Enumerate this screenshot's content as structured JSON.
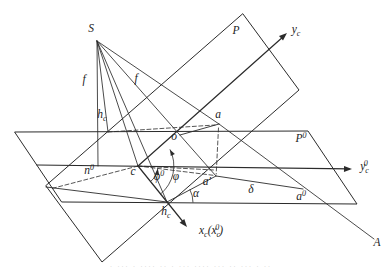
{
  "figure": {
    "background": "#ffffff",
    "line_color": "#2b2b2b",
    "labels": [
      {
        "id": "S",
        "x": 91,
        "y": 29,
        "seg": [
          {
            "t": "S"
          }
        ]
      },
      {
        "id": "f-left",
        "x": 84,
        "y": 80,
        "seg": [
          {
            "t": "f"
          }
        ]
      },
      {
        "id": "f-right",
        "x": 136,
        "y": 79,
        "seg": [
          {
            "t": "f"
          }
        ]
      },
      {
        "id": "P",
        "x": 236,
        "y": 31,
        "seg": [
          {
            "t": "P"
          }
        ]
      },
      {
        "id": "y-c",
        "x": 296,
        "y": 31,
        "seg": [
          {
            "t": "y"
          },
          {
            "t": "c",
            "m": "sub"
          }
        ]
      },
      {
        "id": "h-c-upper",
        "x": 102,
        "y": 116,
        "seg": [
          {
            "t": "h"
          },
          {
            "t": "c",
            "m": "sub"
          }
        ]
      },
      {
        "id": "a",
        "x": 218,
        "y": 115,
        "seg": [
          {
            "t": "a"
          }
        ]
      },
      {
        "id": "o",
        "x": 174,
        "y": 137,
        "seg": [
          {
            "t": "o"
          }
        ]
      },
      {
        "id": "n-0",
        "x": 89,
        "y": 170,
        "seg": [
          {
            "t": "n"
          },
          {
            "t": "0",
            "m": "sup"
          }
        ]
      },
      {
        "id": "c",
        "x": 133,
        "y": 172,
        "seg": [
          {
            "t": "c"
          }
        ]
      },
      {
        "id": "phi-0",
        "x": 159,
        "y": 176,
        "seg": [
          {
            "t": "φ"
          },
          {
            "t": "0",
            "m": "sup"
          }
        ]
      },
      {
        "id": "phi",
        "x": 176,
        "y": 177,
        "seg": [
          {
            "t": "φ"
          }
        ]
      },
      {
        "id": "a-prime",
        "x": 207,
        "y": 182,
        "seg": [
          {
            "t": "a′"
          }
        ]
      },
      {
        "id": "alpha",
        "x": 196,
        "y": 194,
        "seg": [
          {
            "t": "α"
          }
        ]
      },
      {
        "id": "delta",
        "x": 251,
        "y": 190,
        "seg": [
          {
            "t": "δ"
          }
        ]
      },
      {
        "id": "a-0",
        "x": 301,
        "y": 196,
        "seg": [
          {
            "t": "a"
          },
          {
            "t": "0",
            "m": "sup"
          }
        ]
      },
      {
        "id": "P-0",
        "x": 301,
        "y": 138,
        "seg": [
          {
            "t": "P"
          },
          {
            "t": "0",
            "m": "sup"
          }
        ]
      },
      {
        "id": "y-c-0",
        "x": 364,
        "y": 167,
        "seg": [
          {
            "t": "y"
          },
          {
            "t": "c",
            "m": "sub"
          },
          {
            "t": "0",
            "m": "sup stack"
          }
        ]
      },
      {
        "id": "h-c-lower",
        "x": 166,
        "y": 213,
        "seg": [
          {
            "t": "h"
          },
          {
            "t": "c",
            "m": "sub"
          }
        ]
      },
      {
        "id": "x-c",
        "x": 211,
        "y": 231,
        "seg": [
          {
            "t": "x"
          },
          {
            "t": "c",
            "m": "sub"
          },
          {
            "t": "("
          },
          {
            "t": "x"
          },
          {
            "t": "c",
            "m": "sub"
          },
          {
            "t": "0",
            "m": "sup stack"
          },
          {
            "t": ")"
          }
        ]
      },
      {
        "id": "A",
        "x": 377,
        "y": 243,
        "seg": [
          {
            "t": "A"
          }
        ]
      }
    ],
    "caption_fragment": "· ··· · ···· ·· · ··· ···· ··· ·· ··· · ··"
  }
}
